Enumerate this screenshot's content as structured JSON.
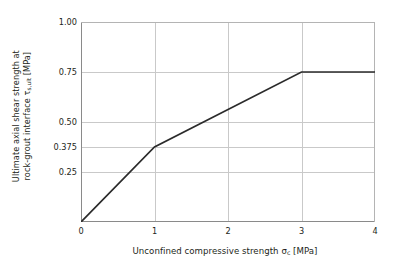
{
  "chart_data": {
    "type": "line",
    "title": "",
    "xlabel": "Unconfined compressive strength σc [MPa]",
    "xlabel_main": "Unconfined compressive strength σ",
    "xlabel_sub": "c",
    "xlabel_unit": " [MPa]",
    "ylabel": "Ultimate axial shear strength at rock-grout interface τs,ult [MPa]",
    "ylabel_line1": "Ultimate axial shear strength at",
    "ylabel_line2_main": "rock-grout interface τ",
    "ylabel_line2_sub": "s,ult",
    "ylabel_line2_unit": " [MPa]",
    "xlim": [
      0,
      4
    ],
    "ylim": [
      0,
      1.0
    ],
    "grid": true,
    "legend": false,
    "xticks": [
      0,
      1,
      2,
      3,
      4
    ],
    "xtick_labels": [
      "0",
      "1",
      "2",
      "3",
      "4"
    ],
    "yticks": [
      0.25,
      0.375,
      0.5,
      0.75,
      1.0
    ],
    "ytick_labels": [
      "0.25",
      "0.375",
      "0.50",
      "0.75",
      "1.00"
    ],
    "series": [
      {
        "name": "Ultimate axial shear strength",
        "color": "#2b2b2b",
        "x": [
          0,
          1,
          3,
          4
        ],
        "values": [
          0,
          0.375,
          0.75,
          0.75
        ]
      }
    ]
  },
  "style": {
    "line_color": "#2b2b2b",
    "grid_color": "#c9c9c9",
    "axis_color": "#8a8a8a",
    "background": "#ffffff",
    "text_color": "#231f20"
  }
}
